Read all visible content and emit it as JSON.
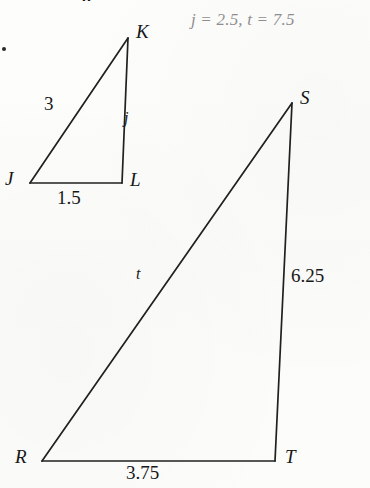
{
  "page": {
    "width": 370,
    "height": 488,
    "background_color": "#fcfcfb",
    "ink_color": "#1c1c1c",
    "answer_color": "#8e8e90"
  },
  "header": {
    "clipped_text": "g"
  },
  "answer_key": {
    "text": "j = 2.5, t = 7.5",
    "j_label": "j",
    "j_equals": "=",
    "j_value": "2.5",
    "separator": ",",
    "t_label": "t",
    "t_equals": "=",
    "t_value": "7.5"
  },
  "figures": [
    {
      "name": "triangle-jkl",
      "vertices": [
        {
          "label": "J",
          "x": 30,
          "y": 183
        },
        {
          "label": "K",
          "x": 128,
          "y": 38
        },
        {
          "label": "L",
          "x": 122,
          "y": 183
        }
      ],
      "vertex_labels": [
        {
          "label": "J",
          "x": 5,
          "y": 169
        },
        {
          "label": "K",
          "x": 136,
          "y": 22
        },
        {
          "label": "L",
          "x": 130,
          "y": 170
        }
      ],
      "side_labels": [
        {
          "name": "side-jk",
          "text": "3",
          "x": 44,
          "y": 94,
          "kind": "measure"
        },
        {
          "name": "side-kl",
          "text": "j",
          "x": 124,
          "y": 110,
          "kind": "variable"
        },
        {
          "name": "side-jl",
          "text": "1.5",
          "x": 57,
          "y": 188,
          "kind": "measure"
        }
      ]
    },
    {
      "name": "triangle-rst",
      "vertices": [
        {
          "label": "R",
          "x": 42,
          "y": 461
        },
        {
          "label": "S",
          "x": 292,
          "y": 103
        },
        {
          "label": "T",
          "x": 275,
          "y": 461
        }
      ],
      "vertex_labels": [
        {
          "label": "R",
          "x": 15,
          "y": 447
        },
        {
          "label": "S",
          "x": 300,
          "y": 88
        },
        {
          "label": "T",
          "x": 285,
          "y": 447
        }
      ],
      "side_labels": [
        {
          "name": "side-rs",
          "text": "t",
          "x": 136,
          "y": 266,
          "kind": "variable"
        },
        {
          "name": "side-st",
          "text": "6.25",
          "x": 291,
          "y": 266,
          "kind": "measure"
        },
        {
          "name": "side-rt",
          "text": "3.75",
          "x": 126,
          "y": 463,
          "kind": "measure"
        }
      ]
    }
  ],
  "icons": {
    "bullet": "problem-bullet"
  }
}
